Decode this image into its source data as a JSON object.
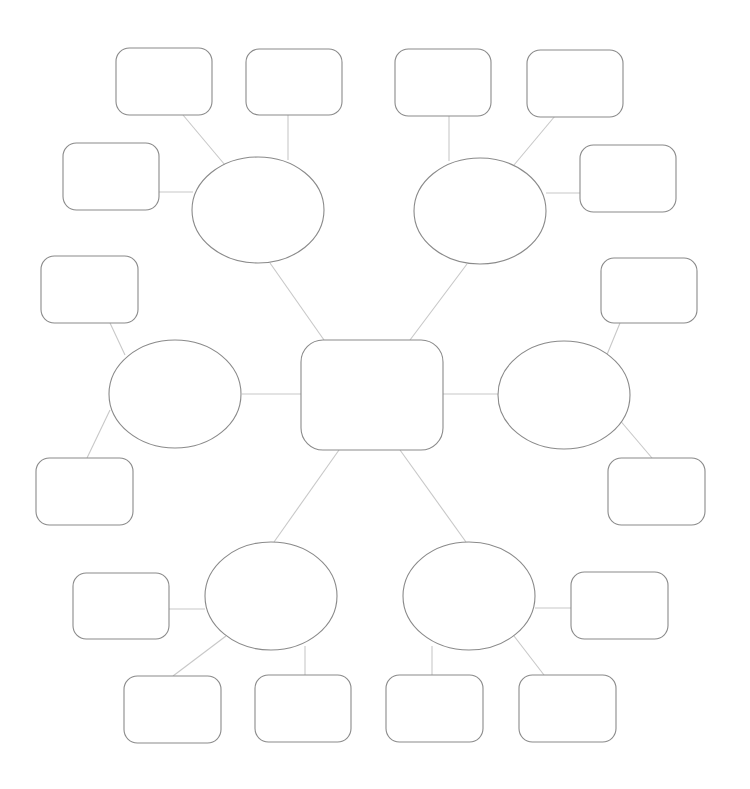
{
  "diagram": {
    "type": "mind-map",
    "center": {
      "id": "center",
      "shape": "rounded-rect",
      "x": 301,
      "y": 340,
      "w": 142,
      "h": 110,
      "label": ""
    },
    "branches": [
      {
        "id": "top-left",
        "shape": "ellipse",
        "cx": 258,
        "cy": 210,
        "rx": 66,
        "ry": 53,
        "label": "",
        "leaves": [
          {
            "id": "tl-1",
            "x": 116,
            "y": 48,
            "w": 96,
            "h": 67,
            "label": ""
          },
          {
            "id": "tl-2",
            "x": 246,
            "y": 49,
            "w": 96,
            "h": 66,
            "label": ""
          },
          {
            "id": "tl-3",
            "x": 63,
            "y": 143,
            "w": 96,
            "h": 67,
            "label": ""
          }
        ]
      },
      {
        "id": "top-right",
        "shape": "ellipse",
        "cx": 480,
        "cy": 211,
        "rx": 66,
        "ry": 53,
        "label": "",
        "leaves": [
          {
            "id": "tr-1",
            "x": 395,
            "y": 49,
            "w": 96,
            "h": 67,
            "label": ""
          },
          {
            "id": "tr-2",
            "x": 527,
            "y": 50,
            "w": 96,
            "h": 67,
            "label": ""
          },
          {
            "id": "tr-3",
            "x": 580,
            "y": 145,
            "w": 96,
            "h": 67,
            "label": ""
          }
        ]
      },
      {
        "id": "left",
        "shape": "ellipse",
        "cx": 175,
        "cy": 394,
        "rx": 66,
        "ry": 54,
        "label": "",
        "leaves": [
          {
            "id": "l-1",
            "x": 41,
            "y": 256,
            "w": 97,
            "h": 67,
            "label": ""
          },
          {
            "id": "l-2",
            "x": 36,
            "y": 458,
            "w": 97,
            "h": 67,
            "label": ""
          }
        ]
      },
      {
        "id": "right",
        "shape": "ellipse",
        "cx": 564,
        "cy": 395,
        "rx": 66,
        "ry": 54,
        "label": "",
        "leaves": [
          {
            "id": "r-1",
            "x": 601,
            "y": 258,
            "w": 96,
            "h": 65,
            "label": ""
          },
          {
            "id": "r-2",
            "x": 608,
            "y": 458,
            "w": 97,
            "h": 67,
            "label": ""
          }
        ]
      },
      {
        "id": "bottom-left",
        "shape": "ellipse",
        "cx": 271,
        "cy": 596,
        "rx": 66,
        "ry": 54,
        "label": "",
        "leaves": [
          {
            "id": "bl-1",
            "x": 73,
            "y": 573,
            "w": 96,
            "h": 66,
            "label": ""
          },
          {
            "id": "bl-2",
            "x": 124,
            "y": 676,
            "w": 97,
            "h": 67,
            "label": ""
          },
          {
            "id": "bl-3",
            "x": 255,
            "y": 675,
            "w": 96,
            "h": 67,
            "label": ""
          }
        ]
      },
      {
        "id": "bottom-right",
        "shape": "ellipse",
        "cx": 469,
        "cy": 596,
        "rx": 66,
        "ry": 54,
        "label": "",
        "leaves": [
          {
            "id": "br-1",
            "x": 571,
            "y": 572,
            "w": 97,
            "h": 67,
            "label": ""
          },
          {
            "id": "br-2",
            "x": 386,
            "y": 675,
            "w": 97,
            "h": 67,
            "label": ""
          },
          {
            "id": "br-3",
            "x": 519,
            "y": 675,
            "w": 97,
            "h": 67,
            "label": ""
          }
        ]
      }
    ],
    "connectors": [
      [
        324,
        340,
        270,
        263
      ],
      [
        410,
        340,
        467,
        264
      ],
      [
        301,
        394,
        242,
        394
      ],
      [
        443,
        394,
        498,
        394
      ],
      [
        339,
        450,
        274,
        542
      ],
      [
        400,
        450,
        466,
        542
      ],
      [
        183,
        115,
        225,
        165
      ],
      [
        288,
        115,
        288,
        160
      ],
      [
        159,
        192,
        193,
        192
      ],
      [
        449,
        116,
        449,
        161
      ],
      [
        555,
        116,
        514,
        165
      ],
      [
        546,
        193,
        580,
        193
      ],
      [
        110,
        323,
        125,
        355
      ],
      [
        112,
        386,
        112,
        386
      ],
      [
        110,
        410,
        87,
        458
      ],
      [
        620,
        323,
        606,
        357
      ],
      [
        618,
        418,
        652,
        458
      ],
      [
        169,
        609,
        205,
        609
      ],
      [
        173,
        676,
        226,
        636
      ],
      [
        305,
        646,
        305,
        675
      ],
      [
        535,
        608,
        571,
        608
      ],
      [
        432,
        646,
        432,
        675
      ],
      [
        514,
        636,
        544,
        675
      ]
    ],
    "colors": {
      "shape_stroke": "#8a8a8a",
      "connector": "#c8c8c8",
      "fill": "#ffffff"
    }
  }
}
